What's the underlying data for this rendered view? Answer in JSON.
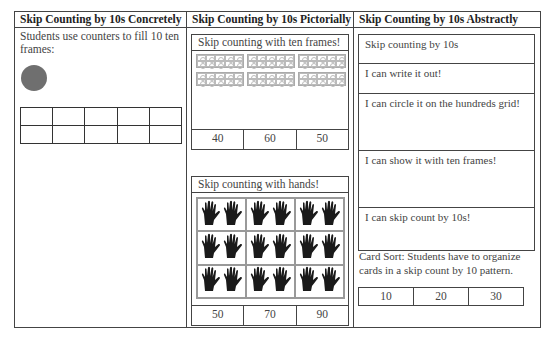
{
  "columns": [
    {
      "header": "Skip Counting by 10s Concretely",
      "description": "Students use counters to fill 10 ten frames:",
      "counter_color": "#6f6f6f",
      "ten_frame": {
        "rows": 2,
        "cols": 5
      }
    },
    {
      "header": "Skip Counting by 10s Pictorially",
      "ten_frames_box": {
        "title": "Skip counting with ten frames!",
        "frame_count": 6,
        "answers": [
          "40",
          "60",
          "50"
        ]
      },
      "hands_box": {
        "title": "Skip counting with hands!",
        "grid": {
          "rows": 3,
          "cols": 3,
          "hands_per_cell": 2
        },
        "answers": [
          "50",
          "70",
          "90"
        ]
      }
    },
    {
      "header": "Skip Counting by 10s Abstractly",
      "rows": [
        {
          "label": "Skip counting by 10s",
          "height": 30
        },
        {
          "label": "I can write it out!",
          "height": 30
        },
        {
          "label": "I can circle it on the hundreds grid!",
          "height": 57
        },
        {
          "label": "I can show it with ten frames!",
          "height": 57
        },
        {
          "label": "I can skip count by 10s!",
          "height": 43
        }
      ],
      "card_sort": "Card Sort: Students have to organize cards in a skip count by 10 pattern.",
      "cards": [
        "10",
        "20",
        "30"
      ]
    }
  ]
}
